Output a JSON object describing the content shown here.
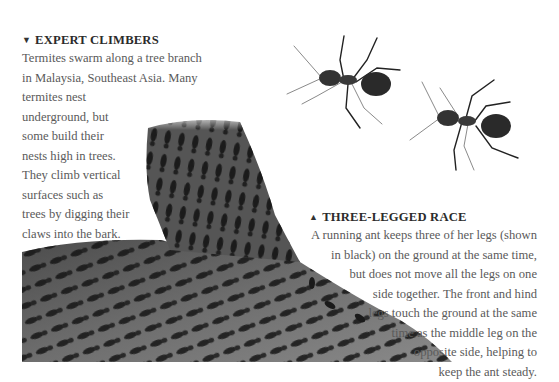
{
  "left_caption": {
    "marker": "▼",
    "heading": "EXPERT CLIMBERS",
    "lines": [
      "Termites swarm along a tree branch",
      "in Malaysia, Southeast Asia. Many",
      "termites nest",
      "underground, but",
      "some build their",
      "nests high in trees.",
      "They climb vertical",
      "surfaces such as",
      "trees by digging their",
      "claws into the bark."
    ]
  },
  "right_caption": {
    "marker": "▲",
    "heading": "THREE-LEGGED RACE",
    "lines": [
      "A running ant keeps three of her legs (shown",
      "in black) on the ground at the same time,",
      "but does not move all the legs on one",
      "side together. The front and hind",
      "legs touch the ground at the same",
      "time as the middle leg on the",
      "opposite side, helping to",
      "keep the ant steady."
    ]
  },
  "images": {
    "branch": "termites-on-tree-branch-photo",
    "ants": "two-running-ants-illustration"
  },
  "colors": {
    "heading": "#2b2b2b",
    "body_text": "#5a5a5a",
    "background": "#ffffff"
  }
}
